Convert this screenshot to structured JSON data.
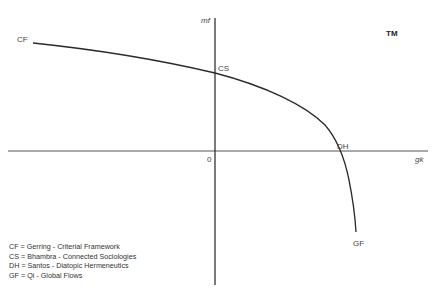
{
  "diagram": {
    "title": "TM",
    "axes": {
      "x_label": "gk",
      "y_label": "mf",
      "origin_label": "0"
    },
    "points": [
      {
        "id": "CF",
        "label": "CF"
      },
      {
        "id": "CS",
        "label": "CS"
      },
      {
        "id": "DH",
        "label": "DH"
      },
      {
        "id": "GF",
        "label": "GF"
      }
    ],
    "legend": [
      "CF = Gerring - Criterial Framework",
      "CS = Bhambra - Connected Sociologies",
      "DH = Santos - Diatopic Hermeneutics",
      "GF = Qi - Global Flows"
    ],
    "colors": {
      "line": "#2a2a2a",
      "axis": "#333333",
      "text": "#444444"
    }
  }
}
